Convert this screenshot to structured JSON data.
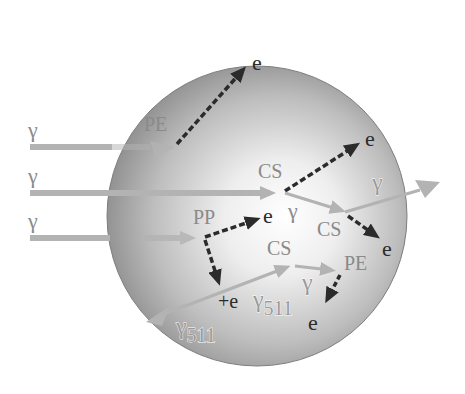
{
  "diagram": {
    "colors": {
      "sphere_edge": "#8c8c8c",
      "sphere_center": "#ffffff",
      "photon_track": "#b3b3b3",
      "electron_track": "#2b2b2b",
      "label_gray": "#8a8a8a",
      "label_dark": "#2b2b2b"
    },
    "incoming_photons": [
      {
        "label": "γ",
        "y": 147
      },
      {
        "label": "γ",
        "y": 193
      },
      {
        "label": "γ",
        "y": 238
      }
    ],
    "labels": {
      "pe_top": "PE",
      "e_top": "e",
      "cs_1": "CS",
      "e_cs1": "e",
      "gamma_out": "γ",
      "gamma_scatter": "γ",
      "cs_2": "CS",
      "e_cs2": "e",
      "pp": "PP",
      "e_pp": "e",
      "positron": "+e",
      "gamma511_a": "γ",
      "gamma511_a_sub": "511",
      "cs_3": "CS",
      "gamma_3": "γ",
      "pe_bottom": "PE",
      "e_pe_bottom": "e",
      "gamma511_b": "γ",
      "gamma511_b_sub": "511"
    },
    "legend_terms": {
      "PE": "photoelectric effect",
      "CS": "Compton scattering",
      "PP": "pair production",
      "e": "electron",
      "γ": "gamma photon",
      "γ511": "511 keV annihilation photon"
    }
  }
}
